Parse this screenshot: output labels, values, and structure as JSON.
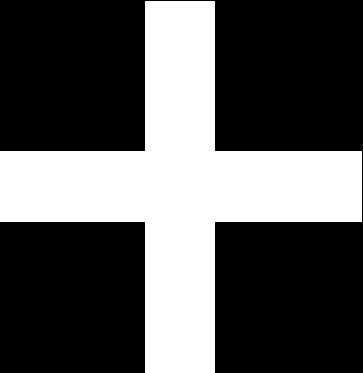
{
  "image": {
    "subject": "cross-icon",
    "background_color": "#000000",
    "foreground_color": "#ffffff",
    "shape": {
      "vertical_bar": {
        "x": 145,
        "y": 1,
        "width": 70,
        "height": 372
      },
      "horizontal_bar": {
        "x": 0,
        "y": 151,
        "width": 362,
        "height": 71
      }
    }
  }
}
